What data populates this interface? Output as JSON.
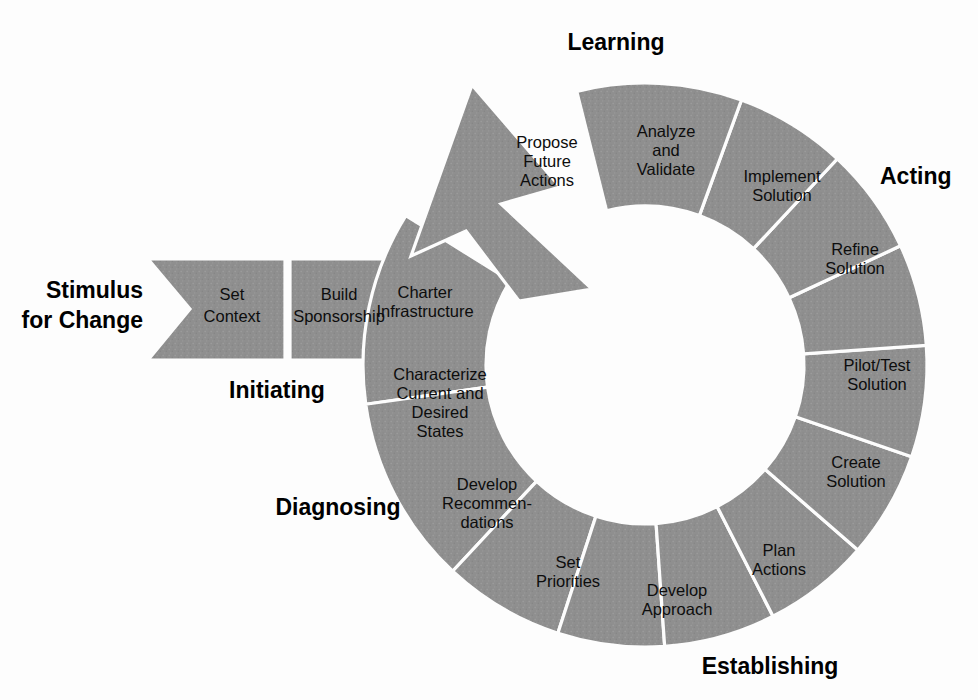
{
  "figure": {
    "fill_color": "#8f8f8f",
    "stroke_color": "#fdfdfd",
    "text_color": "#0d0d0d",
    "background": "#fdfdfd"
  },
  "entry": {
    "stimulus_label_line1": "Stimulus",
    "stimulus_label_line2": "for Change"
  },
  "phases": [
    {
      "id": "learning",
      "label": "Learning",
      "x": 616,
      "y": 44,
      "anchor": "middle"
    },
    {
      "id": "acting",
      "label": "Acting",
      "x": 880,
      "y": 178,
      "anchor": "start"
    },
    {
      "id": "establishing",
      "label": "Establishing",
      "x": 770,
      "y": 668,
      "anchor": "middle"
    },
    {
      "id": "diagnosing",
      "label": "Diagnosing",
      "x": 338,
      "y": 509,
      "anchor": "middle"
    },
    {
      "id": "initiating",
      "label": "Initiating",
      "x": 277,
      "y": 392,
      "anchor": "middle"
    }
  ],
  "tail_steps": [
    {
      "id": "set-context",
      "lines": [
        "Set",
        "Context"
      ],
      "cx": 232,
      "cy": 307
    },
    {
      "id": "build-sponsorship",
      "lines": [
        "Build",
        "Sponsorship"
      ],
      "cx": 339,
      "cy": 307
    }
  ],
  "ring_steps": [
    {
      "id": "charter-infrastructure",
      "lines": [
        "Charter",
        "Infrastructure"
      ],
      "a0": 172.0,
      "a1": 212.0,
      "tx": 425,
      "ty": 303
    },
    {
      "id": "characterize-states",
      "lines": [
        "Characterize",
        "Current and",
        "Desired",
        "States"
      ],
      "a0": 133.0,
      "a1": 172.0,
      "tx": 440,
      "ty": 404
    },
    {
      "id": "develop-recommendations",
      "lines": [
        "Develop",
        "Recommen-",
        "dations"
      ],
      "a0": 108.0,
      "a1": 133.0,
      "tx": 487,
      "ty": 505
    },
    {
      "id": "set-priorities",
      "lines": [
        "Set",
        "Priorities"
      ],
      "a0": 86.0,
      "a1": 108.0,
      "tx": 568,
      "ty": 573
    },
    {
      "id": "develop-approach",
      "lines": [
        "Develop",
        "Approach"
      ],
      "a0": 63.0,
      "a1": 86.0,
      "tx": 677,
      "ty": 601
    },
    {
      "id": "plan-actions",
      "lines": [
        "Plan",
        "Actions"
      ],
      "a0": 41.0,
      "a1": 63.0,
      "tx": 779,
      "ty": 561
    },
    {
      "id": "create-solution",
      "lines": [
        "Create",
        "Solution"
      ],
      "a0": 19.0,
      "a1": 41.0,
      "tx": 856,
      "ty": 473
    },
    {
      "id": "pilot-test-solution",
      "lines": [
        "Pilot/Test",
        "Solution"
      ],
      "a0": -4.0,
      "a1": 19.0,
      "tx": 877,
      "ty": 376
    },
    {
      "id": "refine-solution",
      "lines": [
        "Refine",
        "Solution"
      ],
      "a0": -25.0,
      "a1": -4.0,
      "tx": 855,
      "ty": 260
    },
    {
      "id": "implement-solution",
      "lines": [
        "Implement",
        "Solution"
      ],
      "a0": -47.0,
      "a1": -25.0,
      "tx": 782,
      "ty": 187
    },
    {
      "id": "analyze-and-validate",
      "lines": [
        "Analyze",
        "and",
        "Validate"
      ],
      "a0": -70.0,
      "a1": -47.0,
      "tx": 666,
      "ty": 152
    },
    {
      "id": "propose-future-actions",
      "lines": [
        "Propose",
        "Future",
        "Actions"
      ],
      "a0": -104.0,
      "a1": -70.0,
      "tx": 547,
      "ty": 163
    }
  ],
  "geometry": {
    "center_x": 645,
    "center_y": 365,
    "outer_radius": 282,
    "inner_radius": 159
  }
}
